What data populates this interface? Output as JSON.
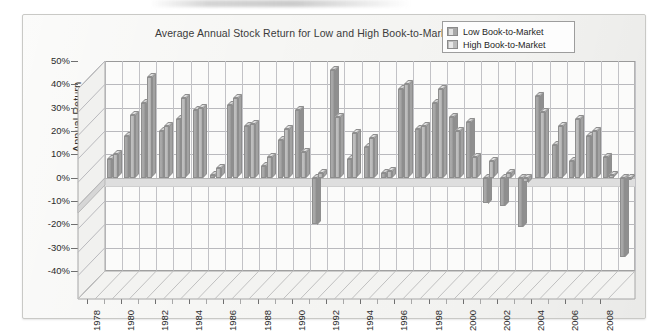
{
  "figure": {
    "title": "Average Annual Stock Return for Low and High Book-to-Market Ratio Firms"
  },
  "legend": {
    "position": "top-right",
    "items": [
      {
        "label": "Low Book-to-Market",
        "color": "#a8a8a8"
      },
      {
        "label": "High Book-to-Market",
        "color": "#bcbcbc"
      }
    ]
  },
  "axes": {
    "ylabel": "Annual Return",
    "xlabel": "",
    "yticks": [
      "50%",
      "40%",
      "30%",
      "20%",
      "10%",
      "0%",
      "-10%",
      "-20%",
      "-30%",
      "-40%"
    ],
    "xticks": [
      "1978",
      "1980",
      "1982",
      "1984",
      "1986",
      "1988",
      "1990",
      "1992",
      "1994",
      "1996",
      "1998",
      "2000",
      "2002",
      "2004",
      "2006",
      "2008"
    ]
  },
  "colors": {
    "low_series": "#a8a8a8",
    "high_series": "#bfbfbf",
    "grid": "#b9b9bd",
    "axis": "#6f6f6f",
    "text": "#2b2b2b",
    "frame": "#c9c9c6",
    "page": "#f6f6f4"
  },
  "chart_data": {
    "type": "bar",
    "title": "Average Annual Stock Return for Low and High Book-to-Market Ratio Firms",
    "xlabel": "",
    "ylabel": "Annual Return",
    "ylim": [
      -40,
      50
    ],
    "ytick_step": 10,
    "grid": true,
    "legend_position": "top-right",
    "three_d": true,
    "categories": [
      "1978",
      "1979",
      "1980",
      "1981",
      "1982",
      "1983",
      "1984",
      "1985",
      "1986",
      "1987",
      "1988",
      "1989",
      "1990",
      "1991",
      "1992",
      "1993",
      "1994",
      "1995",
      "1996",
      "1997",
      "1998",
      "1999",
      "2000",
      "2001",
      "2002",
      "2003",
      "2004",
      "2005",
      "2006",
      "2007",
      "2008"
    ],
    "series": [
      {
        "name": "Low Book-to-Market",
        "values": [
          8,
          18,
          32,
          20,
          25,
          29,
          1,
          31,
          22,
          5,
          16,
          29,
          -20,
          46,
          8,
          13,
          2,
          38,
          21,
          32,
          26,
          24,
          -11,
          -12,
          -21,
          35,
          14,
          7,
          18,
          9,
          -34
        ]
      },
      {
        "name": "High Book-to-Market",
        "values": [
          10,
          27,
          43,
          22,
          34,
          30,
          4,
          34,
          23,
          9,
          21,
          11,
          2,
          26,
          19,
          17,
          3,
          40,
          22,
          38,
          20,
          9,
          7,
          2,
          -2,
          28,
          22,
          25,
          20,
          1,
          -1
        ]
      }
    ]
  }
}
